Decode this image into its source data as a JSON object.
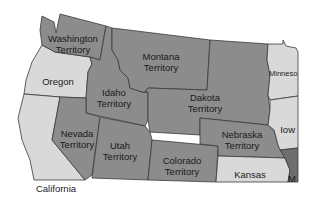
{
  "map": {
    "colors": {
      "territory": "#8c8c8c",
      "state": "#d9d9d9",
      "state_dark": "#6e6e6e",
      "border": "#3a3a3a",
      "background": "#ffffff"
    },
    "regions": {
      "washington": {
        "line1": "Washington",
        "line2": "Territory",
        "type": "territory"
      },
      "montana": {
        "line1": "Montana",
        "line2": "Territory",
        "type": "territory"
      },
      "dakota": {
        "line1": "Dakota",
        "line2": "Territory",
        "type": "territory"
      },
      "idaho": {
        "line1": "Idaho",
        "line2": "Territory",
        "type": "territory"
      },
      "nevada": {
        "line1": "Nevada",
        "line2": "Territory",
        "type": "territory"
      },
      "utah": {
        "line1": "Utah",
        "line2": "Territory",
        "type": "territory"
      },
      "colorado": {
        "line1": "Colorado",
        "line2": "Territory",
        "type": "territory"
      },
      "nebraska": {
        "line1": "Nebraska",
        "line2": "Territory",
        "type": "territory"
      },
      "oregon": {
        "line1": "Oregon",
        "type": "state"
      },
      "california": {
        "line1": "California",
        "type": "state"
      },
      "kansas": {
        "line1": "Kansas",
        "type": "state"
      },
      "minnesota": {
        "line1": "Minneso",
        "type": "state"
      },
      "iowa": {
        "line1": "Iow",
        "type": "state"
      },
      "missouri": {
        "line1": "M",
        "type": "state"
      }
    }
  }
}
